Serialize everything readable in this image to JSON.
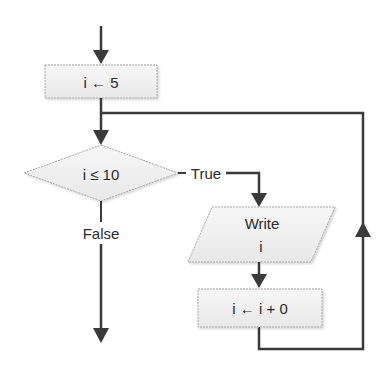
{
  "diagram": {
    "type": "flowchart",
    "colors": {
      "line": "#3a3a3a",
      "shape_fill": "#f0f0f0",
      "shape_border": "#a8a8a8",
      "text": "#2b2b2b"
    },
    "nodes": [
      {
        "id": "init",
        "shape": "process",
        "label": "i ← 5"
      },
      {
        "id": "cond",
        "shape": "decision",
        "label": "i ≤ 10"
      },
      {
        "id": "output",
        "shape": "io",
        "label_line1": "Write",
        "label_line2": "i"
      },
      {
        "id": "update",
        "shape": "process",
        "label": "i ← i + 0"
      }
    ],
    "edges": [
      {
        "from": "start",
        "to": "init"
      },
      {
        "from": "init",
        "to": "cond"
      },
      {
        "from": "cond",
        "to": "output",
        "label": "True"
      },
      {
        "from": "output",
        "to": "update"
      },
      {
        "from": "update",
        "to": "cond",
        "label": ""
      },
      {
        "from": "cond",
        "to": "end",
        "label": "False"
      }
    ],
    "labels": {
      "true": "True",
      "false": "False"
    }
  }
}
